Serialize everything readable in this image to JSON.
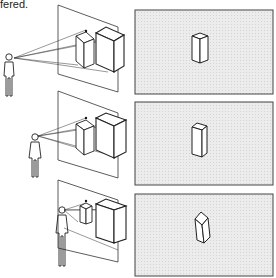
{
  "caption": "fered.",
  "panels": [
    {
      "label": "view-1",
      "viewer_height": "high"
    },
    {
      "label": "view-2",
      "viewer_height": "middle"
    },
    {
      "label": "view-3",
      "viewer_height": "low"
    }
  ],
  "colors": {
    "line": "#222222",
    "panel_fill": "#e6e6e6",
    "panel_border": "#444444",
    "box_fill": "#ffffff"
  }
}
